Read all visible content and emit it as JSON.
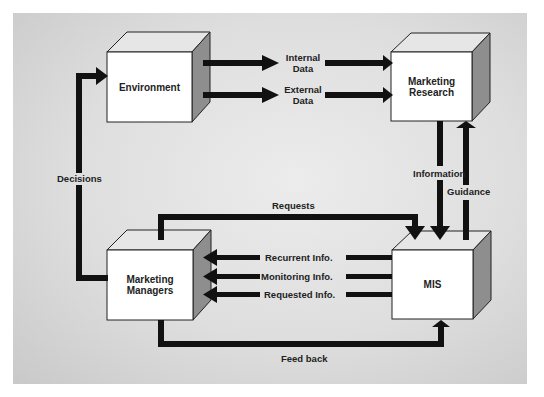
{
  "diagram": {
    "nodes": [
      {
        "id": "environment",
        "label": "Environment"
      },
      {
        "id": "marketing_research",
        "label_line1": "Marketing",
        "label_line2": "Research"
      },
      {
        "id": "marketing_managers",
        "label_line1": "Marketing",
        "label_line2": "Managers"
      },
      {
        "id": "mis",
        "label": "MIS"
      }
    ],
    "edges": {
      "internal_data": {
        "line1": "Internal",
        "line2": "Data",
        "from": "environment",
        "to": "marketing_research"
      },
      "external_data": {
        "line1": "External",
        "line2": "Data",
        "from": "environment",
        "to": "marketing_research"
      },
      "information": {
        "label": "Information",
        "from": "marketing_research",
        "to": "mis"
      },
      "guidance": {
        "label": "Guidance",
        "from": "mis",
        "to": "marketing_research"
      },
      "requests": {
        "label": "Requests",
        "from": "marketing_managers",
        "to": "mis"
      },
      "recurrent_info": {
        "label": "Recurrent Info.",
        "from": "mis",
        "to": "marketing_managers"
      },
      "monitoring_info": {
        "label": "Monitoring Info.",
        "from": "mis",
        "to": "marketing_managers"
      },
      "requested_info": {
        "label": "Requested Info.",
        "from": "mis",
        "to": "marketing_managers"
      },
      "feed_back": {
        "label": "Feed back",
        "from": "marketing_managers",
        "to": "mis"
      },
      "decisions": {
        "label": "Decisions",
        "from": "marketing_managers",
        "to": "environment"
      }
    },
    "colors": {
      "arrow": "#111111",
      "box_front": "#ffffff",
      "box_top": "#e4e4e4",
      "box_side": "#8f8f8f"
    }
  }
}
